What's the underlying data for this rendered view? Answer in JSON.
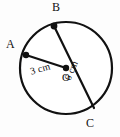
{
  "figure": {
    "type": "circle-geometry-diagram",
    "background_color": "#fdfdfd",
    "stroke_color": "#111111",
    "fill_color": "#ffffff",
    "circle": {
      "center_x": 66,
      "center_y": 68,
      "radius_px": 46,
      "stroke_width": 2.2
    },
    "labels": {
      "point_a": "A",
      "point_b": "B",
      "point_c": "C",
      "center_o": "O",
      "radius_measure": "3 cm",
      "diameter_measure": "6 cm"
    },
    "points": [
      {
        "name": "A",
        "x": 26,
        "y": 55,
        "dot_radius": 3.2
      },
      {
        "name": "B",
        "x": 54,
        "y": 26,
        "dot_radius": 3.4
      },
      {
        "name": "C",
        "x": 94,
        "y": 108,
        "dot_radius": 0
      },
      {
        "name": "O",
        "x": 66,
        "y": 68,
        "dot_radius": 3.2
      }
    ],
    "segments": [
      {
        "name": "radius-OA",
        "from": "O",
        "to": "A",
        "measure": "3 cm",
        "x1": 66,
        "y1": 68,
        "x2": 26,
        "y2": 55
      },
      {
        "name": "diameter-BC",
        "from": "B",
        "to": "C",
        "measure": "6 cm",
        "x1": 54,
        "y1": 26,
        "x2": 94,
        "y2": 108
      }
    ]
  }
}
